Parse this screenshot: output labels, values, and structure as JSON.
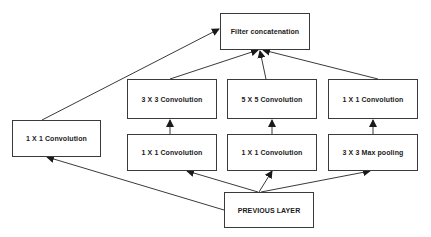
{
  "diagram": {
    "nodes": {
      "filter_concat": "Filter concatenation",
      "conv3x3": "3 X 3 Convolution",
      "conv5x5": "5 X 5 Convolution",
      "conv1x1_pool_proj": "1 X 1 Convolution",
      "conv1x1_direct": "1 X 1 Convolution",
      "conv1x1_reduce_3x3": "1 X 1 Convolution",
      "conv1x1_reduce_5x5": "1 X 1 Convolution",
      "maxpool3x3": "3 X 3 Max pooling",
      "previous_layer": "PREVIOUS LAYER"
    },
    "edges": [
      [
        "previous_layer",
        "conv1x1_direct"
      ],
      [
        "previous_layer",
        "conv1x1_reduce_3x3"
      ],
      [
        "previous_layer",
        "conv1x1_reduce_5x5"
      ],
      [
        "previous_layer",
        "maxpool3x3"
      ],
      [
        "conv1x1_reduce_3x3",
        "conv3x3"
      ],
      [
        "conv1x1_reduce_5x5",
        "conv5x5"
      ],
      [
        "maxpool3x3",
        "conv1x1_pool_proj"
      ],
      [
        "conv1x1_direct",
        "filter_concat"
      ],
      [
        "conv3x3",
        "filter_concat"
      ],
      [
        "conv5x5",
        "filter_concat"
      ],
      [
        "conv1x1_pool_proj",
        "filter_concat"
      ]
    ],
    "colors": {
      "stroke": "#3a3a3a",
      "text": "#1a1a1a",
      "background": "#ffffff"
    }
  }
}
